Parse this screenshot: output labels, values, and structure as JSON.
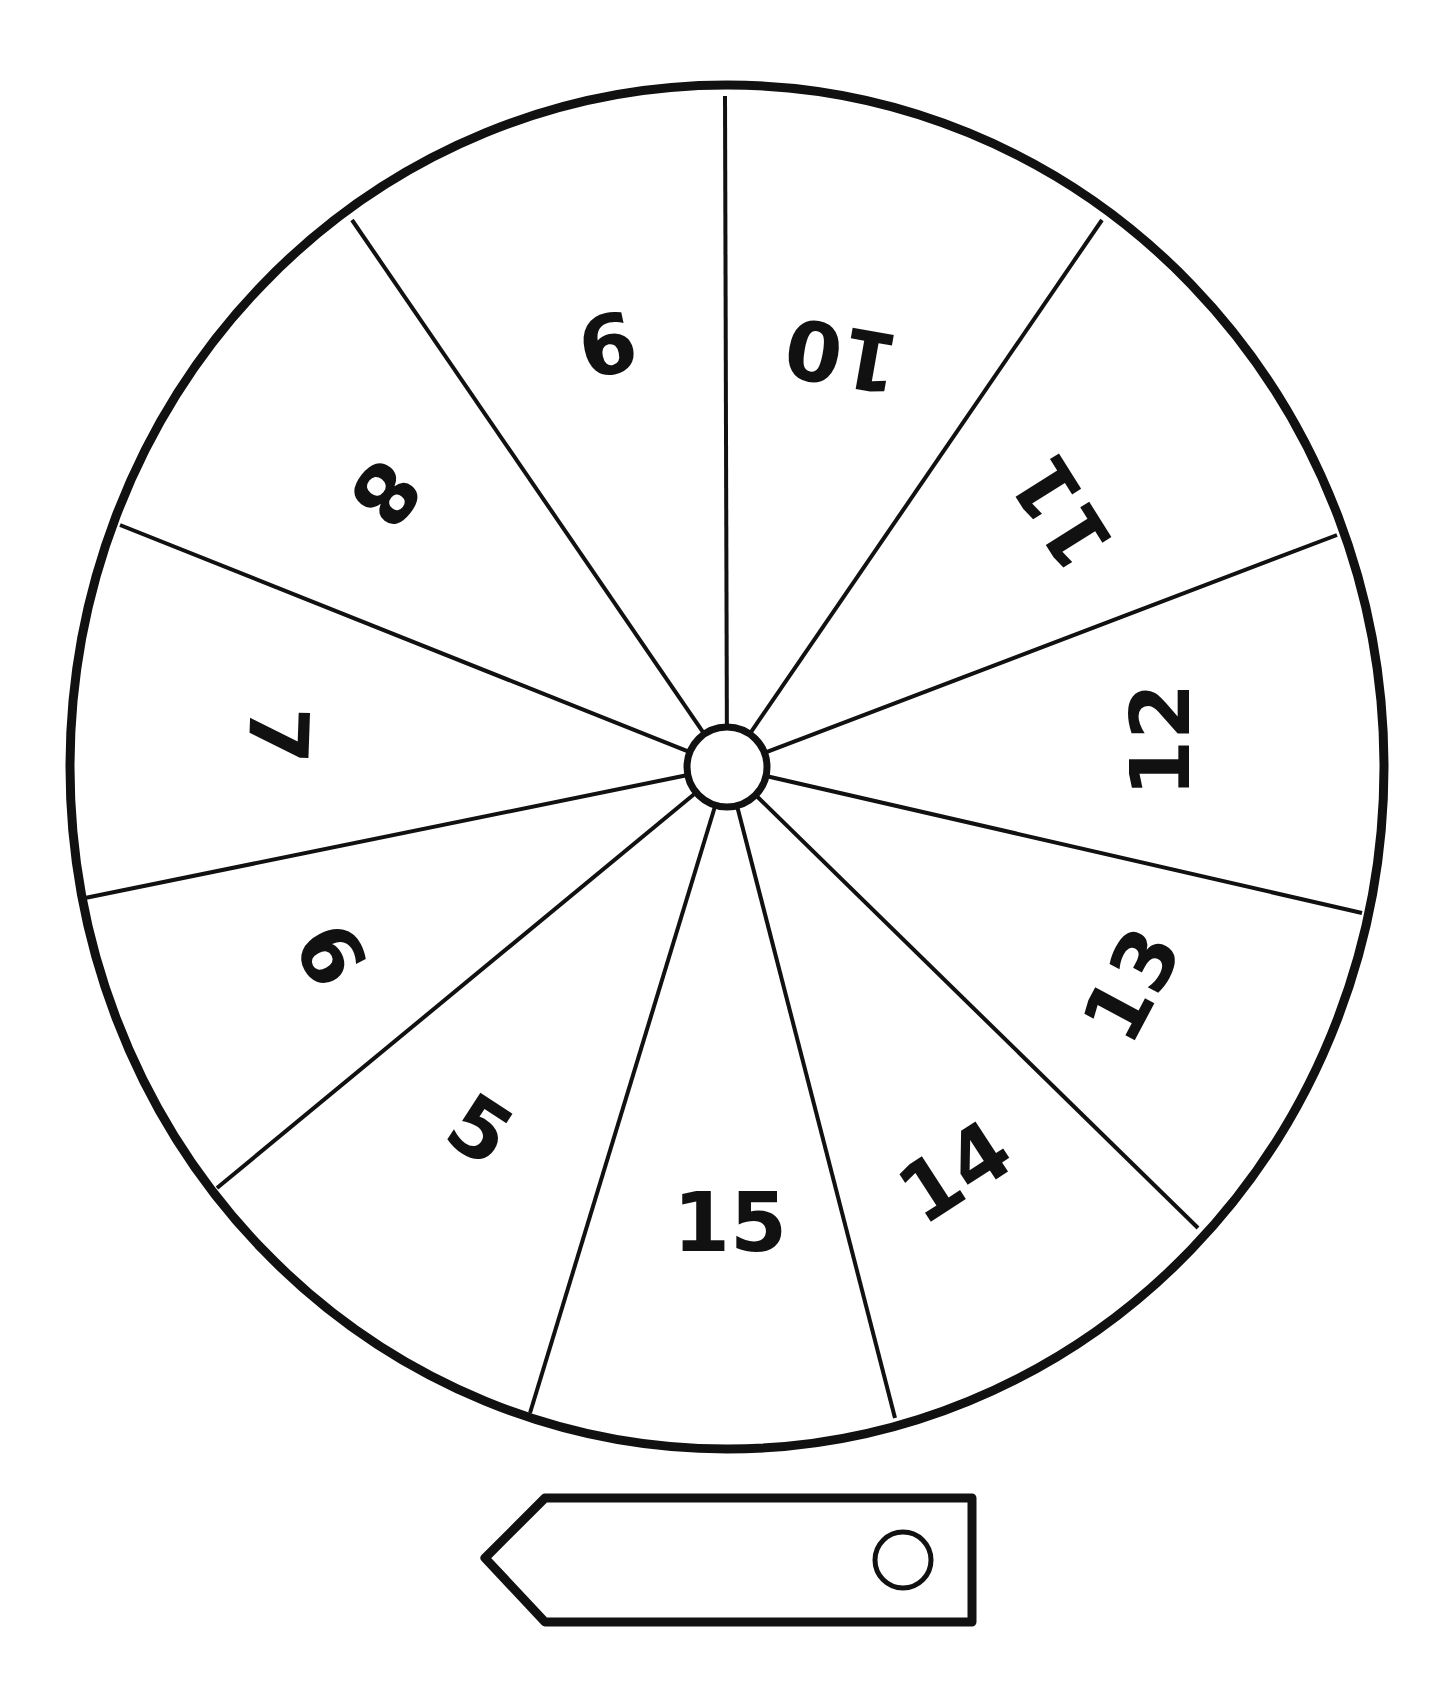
{
  "spinner": {
    "segments": [
      {
        "label": "15",
        "x": 730,
        "y": 1222,
        "rot": 0
      },
      {
        "label": "14",
        "x": 955,
        "y": 1172,
        "rot": -33
      },
      {
        "label": "13",
        "x": 1132,
        "y": 985,
        "rot": -62
      },
      {
        "label": "12",
        "x": 1160,
        "y": 740,
        "rot": -90
      },
      {
        "label": "11",
        "x": 1062,
        "y": 512,
        "rot": -122
      },
      {
        "label": "10",
        "x": 842,
        "y": 355,
        "rot": -170
      },
      {
        "label": "9",
        "x": 607,
        "y": 343,
        "rot": 168
      },
      {
        "label": "8",
        "x": 385,
        "y": 493,
        "rot": 128
      },
      {
        "label": "7",
        "x": 278,
        "y": 735,
        "rot": 92
      },
      {
        "label": "6",
        "x": 330,
        "y": 955,
        "rot": 62
      },
      {
        "label": "5",
        "x": 480,
        "y": 1130,
        "rot": 33
      }
    ],
    "spokes": [
      [
        725,
        96
      ],
      [
        1102,
        220
      ],
      [
        1337,
        535
      ],
      [
        1362,
        913
      ],
      [
        1198,
        1228
      ],
      [
        895,
        1418
      ],
      [
        530,
        1413
      ],
      [
        217,
        1188
      ],
      [
        85,
        898
      ],
      [
        120,
        525
      ],
      [
        352,
        220
      ]
    ],
    "center": {
      "x": 727,
      "y": 767
    },
    "hub_radius": 40,
    "wheel": {
      "rx": 657,
      "ry": 682
    },
    "stroke_color": "#111111"
  },
  "pointer": {
    "tip": [
      485,
      1558
    ],
    "top": 1498,
    "bottom": 1622,
    "shoulder_x": 545,
    "right_x": 972,
    "hole": {
      "x": 903,
      "y": 1560,
      "r": 28
    }
  }
}
